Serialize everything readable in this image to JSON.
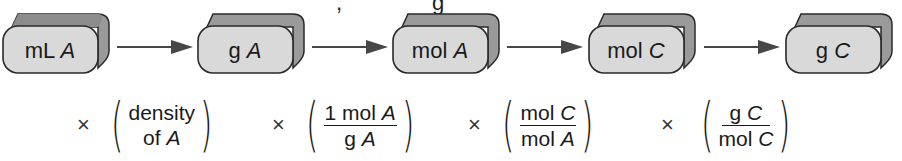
{
  "diagram": {
    "nodes": [
      {
        "id": "n1",
        "unit": "mL",
        "species": "A"
      },
      {
        "id": "n2",
        "unit": "g",
        "species": "A"
      },
      {
        "id": "n3",
        "unit": "mol",
        "species": "A"
      },
      {
        "id": "n4",
        "unit": "mol",
        "species": "C"
      },
      {
        "id": "n5",
        "unit": "g",
        "species": "C"
      }
    ],
    "edges": [
      {
        "from": "n1",
        "to": "n2"
      },
      {
        "from": "n2",
        "to": "n3"
      },
      {
        "from": "n3",
        "to": "n4"
      },
      {
        "from": "n4",
        "to": "n5"
      }
    ],
    "factors": [
      {
        "symbol": "×",
        "type": "text",
        "line1": "density",
        "line2_prefix": "of ",
        "line2_species": "A"
      },
      {
        "symbol": "×",
        "type": "fraction",
        "num_prefix": "1 mol ",
        "num_species": "A",
        "den_prefix": "g ",
        "den_species": "A"
      },
      {
        "symbol": "×",
        "type": "fraction",
        "num_prefix": "mol ",
        "num_species": "C",
        "den_prefix": "mol ",
        "den_species": "A"
      },
      {
        "symbol": "×",
        "type": "fraction",
        "num_prefix": "g ",
        "num_species": "C",
        "den_prefix": "mol ",
        "den_species": "C"
      }
    ],
    "colors": {
      "box_face": "#d9d9d9",
      "box_side": "#9a9a9a",
      "box_outline": "#2a2a2a",
      "arrow": "#474747"
    }
  }
}
